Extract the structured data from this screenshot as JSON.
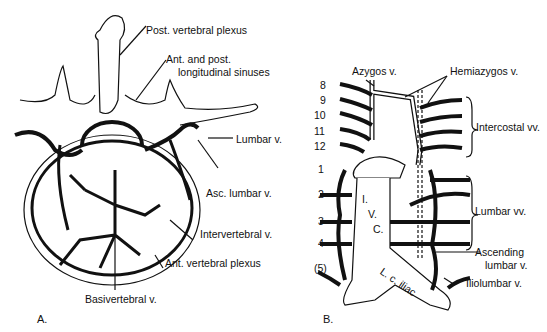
{
  "panel_a": {
    "letter": "A.",
    "labels": {
      "post_vertebral_plexus": "Post. vertebral plexus",
      "longitudinal_sinuses_1": "Ant. and post.",
      "longitudinal_sinuses_2": "longitudinal sinuses",
      "lumbar_v": "Lumbar v.",
      "asc_lumbar_v": "Asc. lumbar v.",
      "intervertebral_v": "Intervertebral v.",
      "ant_vertebral_plexus": "Ant. vertebral plexus",
      "basivertebral_v": "Basivertebral v."
    }
  },
  "panel_b": {
    "letter": "B.",
    "labels": {
      "azygos_v": "Azygos v.",
      "hemiazygos_v": "Hemiazygos v.",
      "intercostal_vv": "Intercostal vv.",
      "lumbar_vv": "Lumbar vv.",
      "ascending_1": "Ascending",
      "ascending_2": "lumbar v.",
      "iliolumbar_v": "Iliolumbar v.",
      "ivc_i": "I.",
      "ivc_v": "V.",
      "ivc_c": "C.",
      "lc_iliac": "L. c. iliac"
    },
    "rib_numbers": [
      "8",
      "9",
      "10",
      "11",
      "12"
    ],
    "lumbar_numbers": [
      "1",
      "2",
      "3",
      "4",
      "(5)"
    ]
  }
}
